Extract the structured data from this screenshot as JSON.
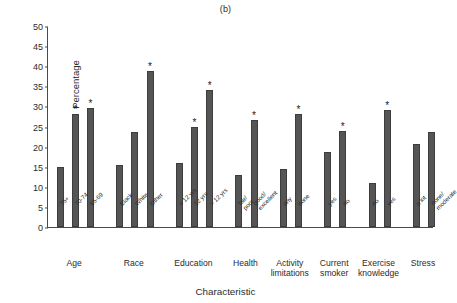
{
  "chart_data": {
    "type": "bar",
    "title": "(b)",
    "xlabel": "Characteristic",
    "ylabel": "Percentage",
    "ylim": [
      0,
      50
    ],
    "yticks": [
      0,
      5,
      10,
      15,
      20,
      25,
      30,
      35,
      40,
      45,
      50
    ],
    "grid": false,
    "legend": null,
    "annotation_marker": "*",
    "annotation_meaning": "statistically significant",
    "bar_color": "#555555",
    "groups": [
      {
        "name": "Age",
        "categories": [
          "75+",
          "70-74",
          "65-69"
        ],
        "values": [
          14.9,
          28.2,
          29.6
        ],
        "significant": [
          false,
          true,
          true
        ]
      },
      {
        "name": "Race",
        "categories": [
          "Black",
          "White",
          "Other"
        ],
        "values": [
          15.4,
          23.7,
          38.8
        ],
        "significant": [
          false,
          false,
          true
        ]
      },
      {
        "name": "Education",
        "categories": [
          "< 12 yrs",
          "12 yrs",
          "> 12 yrs"
        ],
        "values": [
          15.8,
          25.0,
          34.1
        ],
        "significant": [
          false,
          true,
          true
        ]
      },
      {
        "name": "Health",
        "categories": [
          "fair/poor",
          "good/ excellent"
        ],
        "values": [
          12.9,
          26.6
        ],
        "significant": [
          false,
          true
        ]
      },
      {
        "name": "Activity limitations",
        "categories": [
          "any",
          "none"
        ],
        "values": [
          14.4,
          28.1
        ],
        "significant": [
          false,
          true
        ]
      },
      {
        "name": "Current smoker",
        "categories": [
          "yes",
          "no"
        ],
        "values": [
          18.6,
          23.8
        ],
        "significant": [
          false,
          true
        ]
      },
      {
        "name": "Exercise knowledge",
        "categories": [
          "no",
          "yes"
        ],
        "values": [
          11.0,
          29.1
        ],
        "significant": [
          false,
          true
        ]
      },
      {
        "name": "Stress",
        "categories": [
          "a lot",
          "none/ moderate"
        ],
        "values": [
          20.6,
          23.6
        ],
        "significant": [
          false,
          false
        ]
      }
    ]
  }
}
